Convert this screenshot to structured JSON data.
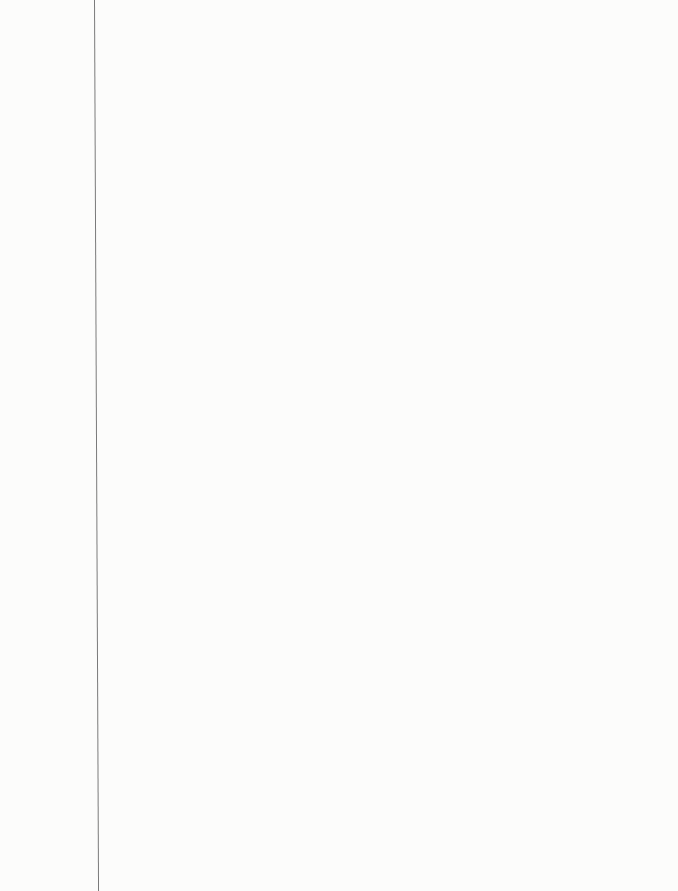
{
  "page": {
    "kind": "blank lined notebook paper",
    "ruled_line_count": 25,
    "colors": {
      "paper": "#fcfcfb",
      "ruled_line": "#9a9a9a",
      "margin_line": "#7a7a7a"
    }
  }
}
